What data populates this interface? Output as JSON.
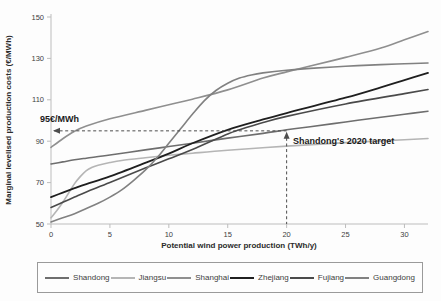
{
  "figure": {
    "kind": "line-chart-scan",
    "title": ""
  },
  "chart_data": {
    "type": "line",
    "title": "",
    "xlabel": "Potential wind power production (TWh/y)",
    "ylabel": "Marginal levelised production costs (€/MWh)",
    "xlim": [
      0,
      32
    ],
    "ylim": [
      50,
      150
    ],
    "x_ticks": [
      0,
      5,
      10,
      15,
      20,
      25,
      30
    ],
    "y_ticks": [
      50,
      70,
      90,
      110,
      130,
      150
    ],
    "grid": false,
    "legend_position": "bottom",
    "series": [
      {
        "name": "Shandong",
        "color": "#6e6e6e",
        "width": 1.6,
        "points": [
          [
            0,
            79
          ],
          [
            1,
            80
          ],
          [
            2,
            81
          ],
          [
            3,
            81.8
          ],
          [
            5,
            83.3
          ],
          [
            8,
            85.8
          ],
          [
            10,
            87.4
          ],
          [
            12,
            89
          ],
          [
            15,
            91.5
          ],
          [
            18,
            93.8
          ],
          [
            20,
            95.5
          ],
          [
            22,
            97
          ],
          [
            25,
            99.3
          ],
          [
            28,
            101.6
          ],
          [
            30,
            103
          ],
          [
            32,
            104.5
          ]
        ]
      },
      {
        "name": "Jiangsu",
        "color": "#b5b5b5",
        "width": 1.6,
        "points": [
          [
            0,
            53
          ],
          [
            0.5,
            56.5
          ],
          [
            1,
            60.5
          ],
          [
            1.5,
            65
          ],
          [
            2,
            69.5
          ],
          [
            2.5,
            73
          ],
          [
            3,
            75.8
          ],
          [
            3.5,
            77.4
          ],
          [
            4,
            78.4
          ],
          [
            5,
            79.7
          ],
          [
            6,
            80.7
          ],
          [
            8,
            82
          ],
          [
            10,
            83.2
          ],
          [
            12,
            84.2
          ],
          [
            15,
            85.6
          ],
          [
            20,
            87.6
          ],
          [
            25,
            89.3
          ],
          [
            30,
            90.7
          ],
          [
            32,
            91.3
          ]
        ]
      },
      {
        "name": "Shanghai",
        "color": "#8f8f8f",
        "width": 1.6,
        "points": [
          [
            0,
            87
          ],
          [
            1,
            91.2
          ],
          [
            2,
            94.8
          ],
          [
            3,
            97.3
          ],
          [
            5,
            100.8
          ],
          [
            8,
            104.9
          ],
          [
            10,
            107.6
          ],
          [
            12,
            110.3
          ],
          [
            15,
            114.8
          ],
          [
            18,
            120.5
          ],
          [
            20,
            123.5
          ],
          [
            22,
            126.3
          ],
          [
            25,
            130.5
          ],
          [
            28,
            135
          ],
          [
            30,
            139
          ],
          [
            32,
            143
          ]
        ]
      },
      {
        "name": "Zhejiang",
        "color": "#1f1f1f",
        "width": 1.8,
        "points": [
          [
            0,
            63
          ],
          [
            1,
            65.2
          ],
          [
            2,
            67.3
          ],
          [
            3,
            69.3
          ],
          [
            5,
            73
          ],
          [
            8,
            79.5
          ],
          [
            10,
            84
          ],
          [
            12,
            89
          ],
          [
            15,
            95.5
          ],
          [
            18,
            100.5
          ],
          [
            20,
            103.6
          ],
          [
            25,
            111
          ],
          [
            28,
            116
          ],
          [
            30,
            119.5
          ],
          [
            32,
            123
          ]
        ]
      },
      {
        "name": "Fujiang",
        "color": "#4a4a4a",
        "width": 1.6,
        "points": [
          [
            0,
            58
          ],
          [
            1,
            60.5
          ],
          [
            2,
            63
          ],
          [
            3,
            65.5
          ],
          [
            5,
            70
          ],
          [
            8,
            77
          ],
          [
            10,
            81.5
          ],
          [
            12,
            86
          ],
          [
            15,
            93.5
          ],
          [
            16,
            95.5
          ],
          [
            18,
            99
          ],
          [
            20,
            102
          ],
          [
            25,
            108
          ],
          [
            30,
            113
          ],
          [
            32,
            115
          ]
        ]
      },
      {
        "name": "Guangdong",
        "color": "#818181",
        "width": 1.6,
        "points": [
          [
            0,
            51
          ],
          [
            1,
            53
          ],
          [
            2,
            55
          ],
          [
            3,
            57.5
          ],
          [
            4,
            60
          ],
          [
            5,
            63
          ],
          [
            6,
            66.5
          ],
          [
            7,
            71
          ],
          [
            8,
            76
          ],
          [
            9,
            82
          ],
          [
            10,
            89
          ],
          [
            11,
            96
          ],
          [
            12,
            103
          ],
          [
            13,
            109.5
          ],
          [
            14,
            114.5
          ],
          [
            15,
            118
          ],
          [
            16,
            120.5
          ],
          [
            17,
            122
          ],
          [
            18,
            123
          ],
          [
            20,
            124.3
          ],
          [
            22,
            125.2
          ],
          [
            25,
            126.2
          ],
          [
            28,
            127
          ],
          [
            30,
            127.4
          ],
          [
            32,
            127.8
          ]
        ]
      }
    ],
    "annotations": [
      {
        "id": "price-line",
        "text": "95€/MWh",
        "y": 95,
        "x_start": 0,
        "x_end": 20,
        "style": "dashed-horizontal-arrow-left"
      },
      {
        "id": "target-line",
        "text": "Shandong's 2020 target",
        "x": 20,
        "y_top": 95,
        "style": "dashed-vertical-arrow-up"
      }
    ]
  }
}
